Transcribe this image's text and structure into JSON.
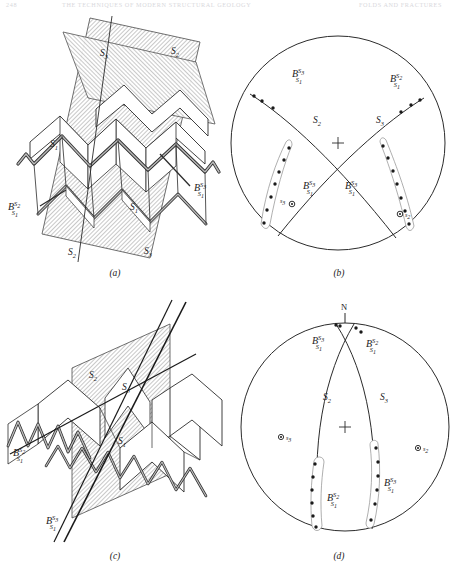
{
  "header": {
    "left": "248",
    "middle": "THE TECHNIQUES OF MODERN STRUCTURAL GEOLOGY",
    "right": "FOLDS AND FRACTURES"
  },
  "figure": {
    "panels": [
      {
        "id": "a",
        "caption": "(a)",
        "type": "block-diagram",
        "description": "Chevron-folded S1 surface cut by two intersecting planar surfaces S2 and S3",
        "labels": [
          {
            "name": "plane-label-s3-top",
            "base": "S",
            "sub": "3",
            "x": 100,
            "y": 42
          },
          {
            "name": "plane-label-s2-top",
            "base": "S",
            "sub": "2",
            "x": 171,
            "y": 40
          },
          {
            "name": "folded-surface-label-s1-left",
            "base": "S",
            "sub": "1",
            "x": 50,
            "y": 133
          },
          {
            "name": "folded-surface-label-s1-mid",
            "base": "S",
            "sub": "1",
            "x": 130,
            "y": 196
          },
          {
            "name": "plane-label-s2-bottom",
            "base": "S",
            "sub": "2",
            "x": 68,
            "y": 241
          },
          {
            "name": "plane-label-s3-bottom",
            "base": "S",
            "sub": "3",
            "x": 144,
            "y": 240
          }
        ],
        "lineations": [
          {
            "name": "lineation-b-s2-s1",
            "base": "B",
            "sup": "S",
            "sup_sub": "2",
            "sub": "S",
            "sub_sub": "1",
            "x": 8,
            "y": 196
          },
          {
            "name": "lineation-b-s3-s1",
            "base": "B",
            "sup": "S",
            "sup_sub": "3",
            "sub": "S",
            "sub_sub": "1",
            "x": 194,
            "y": 177
          }
        ]
      },
      {
        "id": "b",
        "caption": "(b)",
        "type": "stereonet",
        "description": "Equal-area stereographic projection with great circles S2 and S3 and B lineation girdles",
        "center": {
          "x": 338,
          "y": 143
        },
        "radius": 107,
        "center_cross": "+",
        "labels": [
          {
            "name": "great-circle-label-s2",
            "base": "S",
            "sub": "2",
            "x": 313,
            "y": 123
          },
          {
            "name": "great-circle-label-s3",
            "base": "S",
            "sub": "3",
            "x": 377,
            "y": 123
          }
        ],
        "poles": [
          {
            "name": "pole-s3",
            "base": "s",
            "sub": "3",
            "x": 284,
            "y": 191,
            "marker": "circle-dot"
          },
          {
            "name": "pole-s2",
            "base": "s",
            "sub": "2",
            "x": 406,
            "y": 200,
            "marker": "circle-dot"
          }
        ],
        "lineations": [
          {
            "name": "lineation-b-s3-s1-upper-left",
            "base": "B",
            "sup": "S",
            "sup_sub": "3",
            "sub": "S",
            "sub_sub": "1",
            "x": 292,
            "y": 72
          },
          {
            "name": "lineation-b-s2-s1-upper-right",
            "base": "B",
            "sup": "S",
            "sup_sub": "2",
            "sub": "S",
            "sub_sub": "1",
            "x": 390,
            "y": 77
          },
          {
            "name": "lineation-b-s3-s1-lower-left",
            "base": "B",
            "sup": "S",
            "sup_sub": "3",
            "sub": "S",
            "sub_sub": "1",
            "x": 303,
            "y": 184
          },
          {
            "name": "lineation-b-s3-s1-lower-right",
            "base": "B",
            "sup": "S",
            "sup_sub": "3",
            "sub": "S",
            "sub_sub": "1",
            "x": 372,
            "y": 184
          }
        ]
      },
      {
        "id": "c",
        "caption": "(c)",
        "type": "block-diagram",
        "description": "Chevron-folded S1 surface cut by a steeply dipping plane, showing S2 and S3 traces",
        "labels": [
          {
            "name": "plane-label-s2",
            "base": "S",
            "sub": "2",
            "x": 89,
            "y": 374
          },
          {
            "name": "plane-label-s3",
            "base": "S",
            "sub": "3",
            "x": 122,
            "y": 386
          },
          {
            "name": "folded-surface-label-s1",
            "base": "S",
            "sub": "1",
            "x": 118,
            "y": 440
          }
        ],
        "lineations": [
          {
            "name": "lineation-b-s2-s1",
            "base": "B",
            "sup": "S",
            "sup_sub": "2",
            "sub": "S",
            "sub_sub": "1",
            "x": 13,
            "y": 452
          },
          {
            "name": "lineation-b-s3-s1",
            "base": "B",
            "sup": "S",
            "sup_sub": "3",
            "sub": "S",
            "sub_sub": "1",
            "x": 46,
            "y": 520
          }
        ]
      },
      {
        "id": "d",
        "caption": "(d)",
        "type": "stereonet",
        "description": "Equal-area stereographic projection with steep great circles S2 and S3, north marked",
        "center": {
          "x": 345,
          "y": 427
        },
        "radius": 104,
        "center_cross": "+",
        "north_label": "N",
        "labels": [
          {
            "name": "great-circle-label-s2",
            "base": "S",
            "sub": "2",
            "x": 323,
            "y": 396
          },
          {
            "name": "great-circle-label-s3",
            "base": "S",
            "sub": "3",
            "x": 380,
            "y": 396
          }
        ],
        "poles": [
          {
            "name": "pole-s3",
            "base": "s",
            "sub": "3",
            "x": 281,
            "y": 437,
            "marker": "circle-dot"
          },
          {
            "name": "pole-s2",
            "base": "s",
            "sub": "2",
            "x": 423,
            "y": 448,
            "marker": "circle-dot"
          }
        ],
        "lineations": [
          {
            "name": "lineation-b-s3-s1-upper-left",
            "base": "B",
            "sup": "S",
            "sup_sub": "3",
            "sub": "S",
            "sub_sub": "1",
            "x": 312,
            "y": 340
          },
          {
            "name": "lineation-b-s2-s1-upper-right",
            "base": "B",
            "sup": "S",
            "sup_sub": "2",
            "sub": "S",
            "sub_sub": "1",
            "x": 366,
            "y": 343
          },
          {
            "name": "lineation-b-s2-s1-lower-left",
            "base": "B",
            "sup": "S",
            "sup_sub": "2",
            "sub": "S",
            "sub_sub": "1",
            "x": 327,
            "y": 497
          },
          {
            "name": "lineation-b-s3-s1-lower-right",
            "base": "B",
            "sup": "S",
            "sup_sub": "3",
            "sub": "S",
            "sub_sub": "1",
            "x": 385,
            "y": 486
          }
        ]
      }
    ],
    "captions": {
      "a": "(a)",
      "b": "(b)",
      "c": "(c)",
      "d": "(d)"
    }
  },
  "colors": {
    "ink": "#1a1a1a",
    "hatch": "#9a9a9a",
    "shade_fill": "#c9c9c9",
    "paper": "#ffffff",
    "header_faint": "#d8d8dc"
  }
}
